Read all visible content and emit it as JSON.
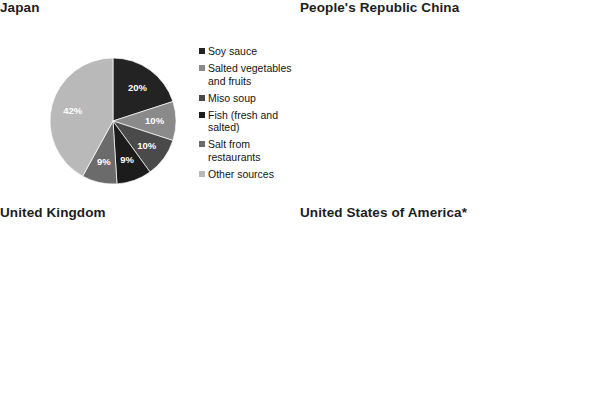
{
  "figure": {
    "background": "#ffffff",
    "footnote": "* Contribution of food sources may be underestimated\ndue to coding of the data."
  },
  "palette": {
    "very_dark": "#232323",
    "mid_gray": "#8a8a8a",
    "dark_gray": "#555555",
    "near_black": "#1c1c1c",
    "dark2": "#3d3d3d",
    "light_gray": "#b5b5b5",
    "lighter_gray": "#c9c9c9",
    "medium": "#6f6f6f"
  },
  "chart_data": [
    {
      "id": "japan",
      "type": "pie",
      "title": "Japan",
      "legend_position": "right",
      "categories": [
        "Soy sauce",
        "Salted vegetables\nand fruits",
        "Miso soup",
        "Fish (fresh and\nsalted)",
        "Salt from\nrestaurants",
        "Other sources"
      ],
      "values": [
        20,
        10,
        10,
        9,
        9,
        42
      ],
      "labels": [
        "20%",
        "10%",
        "10%",
        "9%",
        "9%",
        "42%"
      ],
      "colors": [
        "#232323",
        "#8a8a8a",
        "#4a4a4a",
        "#1c1c1c",
        "#6b6b6b",
        "#b9b9b9"
      ],
      "label_colors": [
        "#ffffff",
        "#ffffff",
        "#ffffff",
        "#ffffff",
        "#ffffff",
        "#ffffff"
      ]
    },
    {
      "id": "china",
      "type": "pie",
      "title": "People's Republic China",
      "legend_position": "right",
      "categories": [
        "Salt added\nduring cooking",
        "Soy sauce",
        "Other sources"
      ],
      "values": [
        76,
        6,
        18
      ],
      "labels": [
        "76%",
        "6%",
        "18%"
      ],
      "colors": [
        "#2f2f2f",
        "#9d9d9d",
        "#3a3a3a"
      ],
      "label_colors": [
        "#ffffff",
        "#ffffff",
        "#ffffff"
      ]
    },
    {
      "id": "uk",
      "type": "pie",
      "title": "United Kingdom",
      "legend_position": "right",
      "categories": [
        "Grain products",
        "Meats",
        "Vegetables",
        "Dairy",
        "Seasoning",
        "Soups",
        "Other sources"
      ],
      "values": [
        35,
        20,
        8,
        8,
        5,
        5,
        19
      ],
      "labels": [
        "35%",
        "20%",
        "8%",
        "8%",
        "5%",
        "5%",
        "19%"
      ],
      "colors": [
        "#2a2a2a",
        "#8d8d8d",
        "#1e1e1e",
        "#3f3f3f",
        "#565656",
        "#c2c2c2",
        "#7c7c7c"
      ],
      "label_colors": [
        "#ffffff",
        "#ffffff",
        "#ffffff",
        "#ffffff",
        "#ffffff",
        "#ffffff",
        "#ffffff"
      ]
    },
    {
      "id": "usa",
      "type": "pie",
      "title": "United States of America*",
      "legend_position": "right",
      "categories": [
        "Salt from home and\nrestaurants",
        "Grain products",
        "Meats",
        "Dairy",
        "Seasoning",
        "Soy sauce",
        "Other sources"
      ],
      "values": [
        29,
        19,
        12,
        8,
        7,
        5,
        20
      ],
      "labels": [
        "29%",
        "19%",
        "12%",
        "8%",
        "7%",
        "5%",
        "20%"
      ],
      "colors": [
        "#262626",
        "#8d8d8d",
        "#6b6b6b",
        "#1e1e1e",
        "#3f3f3f",
        "#c2c2c2",
        "#7c7c7c"
      ],
      "label_colors": [
        "#ffffff",
        "#ffffff",
        "#ffffff",
        "#ffffff",
        "#ffffff",
        "#ffffff",
        "#ffffff"
      ]
    }
  ]
}
